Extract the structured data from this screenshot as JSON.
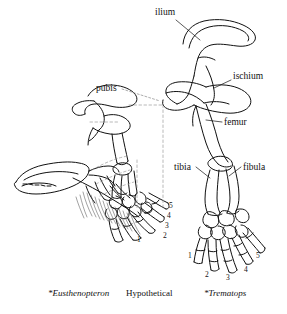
{
  "figure": {
    "background_color": "#ffffff",
    "ink_color": "#111111"
  },
  "anatomy_labels": [
    {
      "id": "ilium",
      "text": "ilium"
    },
    {
      "id": "ischium",
      "text": "ischium"
    },
    {
      "id": "pubis",
      "text": "pubis"
    },
    {
      "id": "femur",
      "text": "femur"
    },
    {
      "id": "tibia",
      "text": "tibia"
    },
    {
      "id": "fibula",
      "text": "fibula"
    }
  ],
  "specimens": [
    {
      "id": "eusthenopteron",
      "caption": "*Eusthenopteron",
      "style": "italic",
      "position": "left"
    },
    {
      "id": "hypothetical",
      "caption": "Hypothetical",
      "style": "roman",
      "position": "center"
    },
    {
      "id": "trematops",
      "caption": "*Trematops",
      "style": "italic",
      "position": "right"
    }
  ],
  "digit_numbers": {
    "hypothetical": [
      "5",
      "4",
      "3",
      "2",
      "1"
    ],
    "trematops": [
      "1",
      "2",
      "3",
      "4",
      "5"
    ]
  }
}
